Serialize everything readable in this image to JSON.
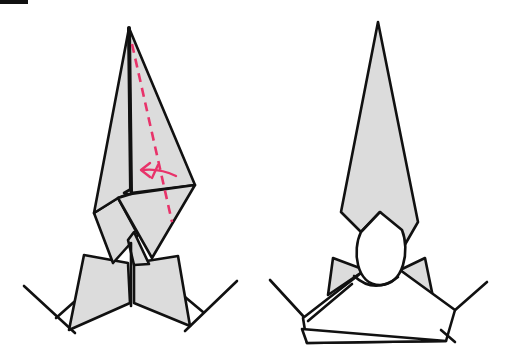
{
  "diagram": {
    "type": "origami-instruction",
    "colors": {
      "paper": "#dcdcdc",
      "outline": "#111111",
      "valley_fold": "#e8336a",
      "arrow": "#e8336a",
      "corner_mark": "#111111"
    },
    "steps": [
      {
        "id": "step-a",
        "description": "Valley fold the right flap along the dashed line toward the center",
        "symbols": [
          "valley-fold-line",
          "fold-arrow"
        ]
      },
      {
        "id": "step-b",
        "description": "Result: narrow pointed top with a rounded head and folded base",
        "symbols": []
      }
    ]
  }
}
